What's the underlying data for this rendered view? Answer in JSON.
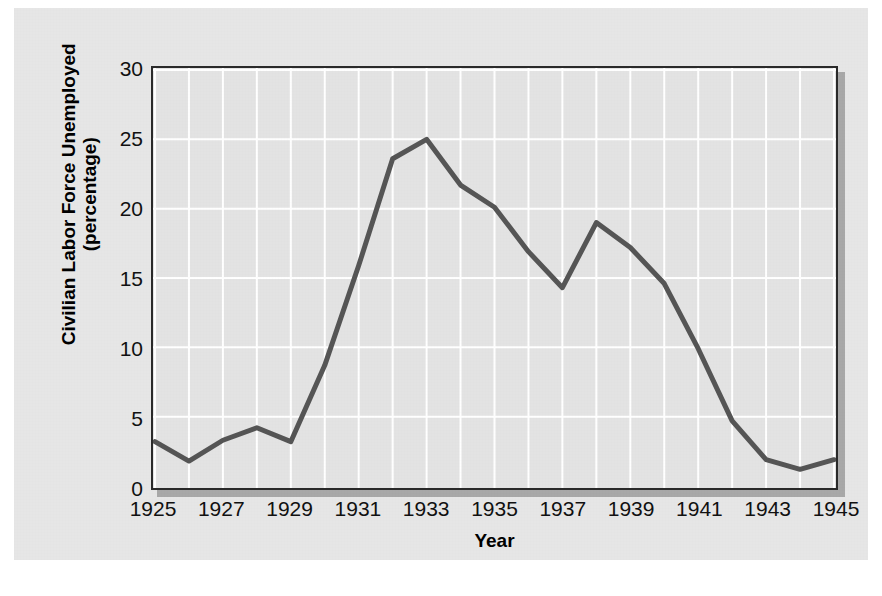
{
  "chart_data": {
    "type": "line",
    "title": "",
    "xlabel": "Year",
    "ylabel": "Civilian Labor Force Unemployed",
    "ylabel_sub": "(percentage)",
    "x": [
      1925,
      1926,
      1927,
      1928,
      1929,
      1930,
      1931,
      1932,
      1933,
      1934,
      1935,
      1936,
      1937,
      1938,
      1939,
      1940,
      1941,
      1942,
      1943,
      1944,
      1945
    ],
    "values": [
      3.2,
      1.8,
      3.3,
      4.2,
      3.2,
      8.7,
      15.9,
      23.6,
      25.0,
      21.7,
      20.1,
      16.9,
      14.3,
      19.0,
      17.2,
      14.6,
      9.9,
      4.7,
      1.9,
      1.2,
      1.9
    ],
    "series": [
      {
        "name": "Civilian Labor Force Unemployed",
        "values": [
          3.2,
          1.8,
          3.3,
          4.2,
          3.2,
          8.7,
          15.9,
          23.6,
          25.0,
          21.7,
          20.1,
          16.9,
          14.3,
          19.0,
          17.2,
          14.6,
          9.9,
          4.7,
          1.9,
          1.2,
          1.9
        ]
      }
    ],
    "xlim": [
      1925,
      1945
    ],
    "ylim": [
      0,
      30
    ],
    "xticks": [
      1925,
      1927,
      1929,
      1931,
      1933,
      1935,
      1937,
      1939,
      1941,
      1943,
      1945
    ],
    "xtick_labels": [
      "1925",
      "1927",
      "1929",
      "1931",
      "1933",
      "1935",
      "1937",
      "1939",
      "1941",
      "1943",
      "1945"
    ],
    "yticks": [
      0,
      5,
      10,
      15,
      20,
      25,
      30
    ],
    "ytick_labels": [
      "0",
      "5",
      "10",
      "15",
      "20",
      "25",
      "30"
    ],
    "grid": true,
    "grid_color": "#ffffff",
    "legend": "none",
    "line_color": "#555555",
    "line_width": 5,
    "plot_background": "#e3e3e3",
    "figure_background": "#e6e6e6",
    "frame_color": "#2a2a2a"
  }
}
